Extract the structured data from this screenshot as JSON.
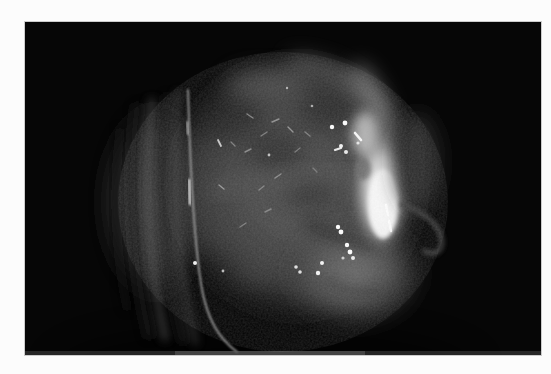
{
  "page": {
    "background": "#fcfcfc"
  },
  "photo": {
    "description": "Endoscopic close-up photograph of a rounded translucent grey tissue mass against a black field; vertical membrane folds on the left, a bright white highlight crescent along the right edge, and scattered specular light reflections across the surface",
    "frame": {
      "x": 25,
      "y": 22,
      "width": 516,
      "height": 333
    },
    "background": "#060606"
  },
  "palette": {
    "field_black": "#060606",
    "mass_dark": "#363636",
    "mass_mid": "#474747",
    "lobe_light": "#6f6f6f",
    "crescent": "#ececec",
    "crescent_core": "#fbfbfb",
    "speck_white": "#ffffff",
    "page_white": "#fcfcfc"
  },
  "scene": {
    "folds": [
      {
        "d": "M95,110 C88,165 90,230 102,285",
        "c": "#101010",
        "w": 9,
        "o": 0.7,
        "f": "b4"
      },
      {
        "d": "M112,86 C104,150 106,235 124,312",
        "c": "#181818",
        "w": 11,
        "o": 0.85,
        "f": "b4"
      },
      {
        "d": "M127,80 C119,150 122,238 140,315",
        "c": "#4a4a4a",
        "w": 8,
        "o": 0.6,
        "f": "b4"
      },
      {
        "d": "M142,76 C134,152 138,242 158,318",
        "c": "#1d1d1d",
        "w": 8,
        "o": 0.8,
        "f": "b4"
      },
      {
        "d": "M153,72 C146,152 150,246 170,320",
        "c": "#505050",
        "w": 6,
        "o": 0.55,
        "f": "b4"
      },
      {
        "d": "M163,68 C165,140 168,210 176,262 C182,300 196,318 212,330",
        "c": "#a8a8a8",
        "w": 1.8,
        "o": 0.9,
        "f": "b1"
      },
      {
        "d": "M164,158 L165,182",
        "c": "#e9e9e9",
        "w": 2.6,
        "o": 0.95,
        "f": "b1"
      },
      {
        "d": "M162,100 L163,112",
        "c": "#cccccc",
        "w": 2.0,
        "o": 0.8,
        "f": "b1"
      }
    ],
    "streaks": [
      {
        "x1": 222,
        "y1": 92,
        "x2": 228,
        "y2": 96,
        "w": 1.4,
        "c": "#c4c4c4",
        "o": 0.55
      },
      {
        "x1": 247,
        "y1": 100,
        "x2": 254,
        "y2": 97,
        "w": 1.4,
        "c": "#c4c4c4",
        "o": 0.6
      },
      {
        "x1": 263,
        "y1": 105,
        "x2": 268,
        "y2": 110,
        "w": 1.4,
        "c": "#cccccc",
        "o": 0.6
      },
      {
        "x1": 236,
        "y1": 114,
        "x2": 242,
        "y2": 110,
        "w": 1.4,
        "c": "#bbbbbb",
        "o": 0.5
      },
      {
        "x1": 220,
        "y1": 130,
        "x2": 226,
        "y2": 127,
        "w": 1.4,
        "c": "#c4c4c4",
        "o": 0.55
      },
      {
        "x1": 280,
        "y1": 110,
        "x2": 285,
        "y2": 114,
        "w": 1.4,
        "c": "#bbbbbb",
        "o": 0.5
      },
      {
        "x1": 270,
        "y1": 130,
        "x2": 275,
        "y2": 126,
        "w": 1.3,
        "c": "#b5b5b5",
        "o": 0.5
      },
      {
        "x1": 288,
        "y1": 146,
        "x2": 292,
        "y2": 150,
        "w": 1.3,
        "c": "#b5b5b5",
        "o": 0.45
      },
      {
        "x1": 250,
        "y1": 156,
        "x2": 256,
        "y2": 152,
        "w": 1.4,
        "c": "#c4c4c4",
        "o": 0.55
      },
      {
        "x1": 234,
        "y1": 168,
        "x2": 239,
        "y2": 164,
        "w": 1.4,
        "c": "#bbbbbb",
        "o": 0.5
      },
      {
        "x1": 206,
        "y1": 120,
        "x2": 210,
        "y2": 124,
        "w": 1.3,
        "c": "#c0c0c0",
        "o": 0.5
      },
      {
        "x1": 194,
        "y1": 163,
        "x2": 199,
        "y2": 167,
        "w": 1.4,
        "c": "#cfcfcf",
        "o": 0.6
      },
      {
        "x1": 193,
        "y1": 118,
        "x2": 196,
        "y2": 124,
        "w": 1.8,
        "c": "#e5e5e5",
        "o": 0.85
      },
      {
        "x1": 215,
        "y1": 205,
        "x2": 221,
        "y2": 201,
        "w": 1.4,
        "c": "#b5b5b5",
        "o": 0.5
      },
      {
        "x1": 240,
        "y1": 190,
        "x2": 246,
        "y2": 187,
        "w": 1.4,
        "c": "#bbbbbb",
        "o": 0.5
      },
      {
        "x1": 361,
        "y1": 183,
        "x2": 363,
        "y2": 193,
        "w": 2.4,
        "c": "#ffffff",
        "o": 0.95
      },
      {
        "x1": 364,
        "y1": 199,
        "x2": 366,
        "y2": 209,
        "w": 2.4,
        "c": "#ffffff",
        "o": 0.9
      },
      {
        "x1": 305,
        "y1": 116,
        "x2": 312,
        "y2": 116,
        "w": 2.6,
        "c": "#ffffff",
        "o": 0.95
      },
      {
        "x1": 310,
        "y1": 128,
        "x2": 316,
        "y2": 126,
        "w": 2.2,
        "c": "#ffffff",
        "o": 0.9
      },
      {
        "x1": 330,
        "y1": 111,
        "x2": 336,
        "y2": 118,
        "w": 2.6,
        "c": "#ffffff",
        "o": 0.95
      }
    ],
    "specks": [
      {
        "x": 307,
        "y": 105,
        "r": 2.2,
        "o": 1
      },
      {
        "x": 320,
        "y": 101,
        "r": 2.4,
        "o": 1
      },
      {
        "x": 316,
        "y": 124,
        "r": 2.0,
        "o": 0.95
      },
      {
        "x": 321,
        "y": 130,
        "r": 2.0,
        "o": 0.9
      },
      {
        "x": 333,
        "y": 121,
        "r": 1.6,
        "o": 0.8
      },
      {
        "x": 313,
        "y": 205,
        "r": 2.2,
        "o": 1
      },
      {
        "x": 316,
        "y": 210,
        "r": 2.4,
        "o": 1
      },
      {
        "x": 322,
        "y": 223,
        "r": 2.2,
        "o": 1
      },
      {
        "x": 325,
        "y": 230,
        "r": 2.4,
        "o": 1
      },
      {
        "x": 328,
        "y": 236,
        "r": 2.0,
        "o": 0.9
      },
      {
        "x": 318,
        "y": 236,
        "r": 1.6,
        "o": 0.7
      },
      {
        "x": 297,
        "y": 241,
        "r": 2.0,
        "o": 0.95
      },
      {
        "x": 293,
        "y": 251,
        "r": 2.2,
        "o": 0.95
      },
      {
        "x": 271,
        "y": 245,
        "r": 1.8,
        "o": 0.85
      },
      {
        "x": 275,
        "y": 250,
        "r": 1.8,
        "o": 0.85
      },
      {
        "x": 170,
        "y": 241,
        "r": 2.0,
        "o": 0.95
      },
      {
        "x": 198,
        "y": 249,
        "r": 1.4,
        "o": 0.7
      },
      {
        "x": 262,
        "y": 66,
        "r": 1.2,
        "o": 0.6
      },
      {
        "x": 287,
        "y": 84,
        "r": 1.3,
        "o": 0.6
      },
      {
        "x": 244,
        "y": 133,
        "r": 1.4,
        "o": 0.7
      }
    ],
    "bottom_strip": [
      {
        "x": 0,
        "y": 329,
        "w": 516,
        "h": 4,
        "c": "#4f4f4f",
        "o": 0.45
      },
      {
        "x": 150,
        "y": 329,
        "w": 190,
        "h": 4,
        "c": "#6a6a6a",
        "o": 0.45
      }
    ]
  }
}
